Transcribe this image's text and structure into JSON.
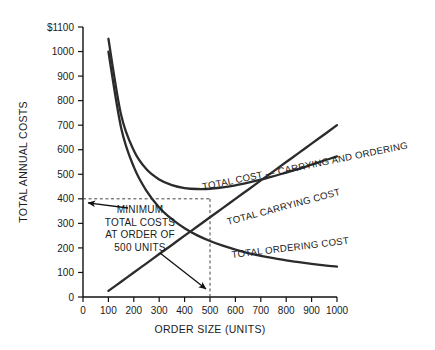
{
  "chart_data": {
    "type": "line",
    "title": "",
    "xlabel": "ORDER SIZE (UNITS)",
    "ylabel": "TOTAL ANNUAL COSTS",
    "xlim": [
      0,
      1000
    ],
    "ylim": [
      0,
      1100
    ],
    "xticks": [
      "0",
      "100",
      "200",
      "300",
      "400",
      "500",
      "600",
      "700",
      "800",
      "900",
      "1000"
    ],
    "yticks": [
      "0",
      "100",
      "200",
      "300",
      "400",
      "500",
      "600",
      "700",
      "800",
      "900",
      "1000",
      "$1100"
    ],
    "grid": false,
    "legend_position": "inline-curve-labels",
    "x": [
      100,
      150,
      200,
      250,
      300,
      350,
      400,
      450,
      500,
      550,
      600,
      650,
      700,
      750,
      800,
      850,
      900,
      950,
      1000
    ],
    "series": [
      {
        "name": "TOTAL COST — CARRYING AND ORDERING",
        "label": "TOTAL COST — CARRYING AND ORDERING",
        "values": [
          1052,
          742,
          597,
          520,
          479,
          456,
          444,
          440,
          441,
          447,
          455,
          466,
          478,
          492,
          507,
          522,
          539,
          556,
          573
        ]
      },
      {
        "name": "TOTAL ORDERING COST",
        "label": "TOTAL ORDERING COST",
        "values": [
          1000,
          690,
          530,
          432,
          365,
          317,
          280,
          251,
          228,
          209,
          193,
          179,
          168,
          158,
          149,
          142,
          135,
          129,
          124
        ]
      },
      {
        "name": "TOTAL CARRYING COST",
        "label": "TOTAL CARRYING COST",
        "values": [
          25,
          62,
          100,
          137,
          175,
          212,
          250,
          287,
          325,
          362,
          400,
          437,
          475,
          512,
          550,
          587,
          625,
          662,
          700
        ]
      }
    ],
    "annotations": [
      {
        "name": "minimum-total-costs-note",
        "lines": [
          "MINIMUM",
          "TOTAL COSTS",
          "AT ORDER OF",
          "500 UNITS"
        ],
        "points_to": [
          [
            0,
            400
          ],
          [
            500,
            0
          ]
        ]
      }
    ],
    "guides": [
      {
        "name": "horizontal-guide-400",
        "axis": "y",
        "value": 400
      },
      {
        "name": "vertical-guide-500",
        "axis": "x",
        "value": 500
      }
    ],
    "colors": {
      "curve": "#2b2b2b",
      "axis": "#111111",
      "guide": "#444444",
      "background": "#ffffff"
    }
  }
}
